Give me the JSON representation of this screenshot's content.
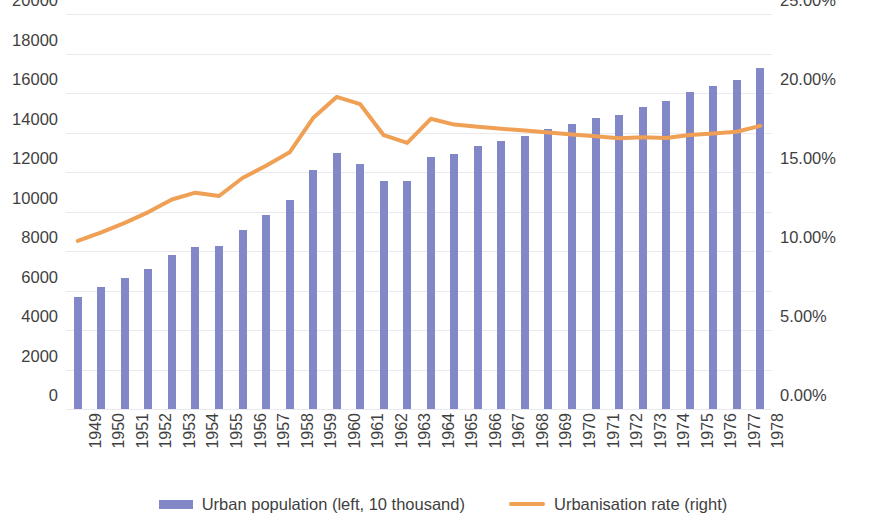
{
  "chart_data": {
    "type": "bar",
    "title": "",
    "subtitle": "",
    "xlabel": "",
    "ylabel": "",
    "y2label": "",
    "grid": true,
    "legend_position": "bottom",
    "categories": [
      "1949",
      "1950",
      "1951",
      "1952",
      "1953",
      "1954",
      "1955",
      "1956",
      "1957",
      "1958",
      "1959",
      "1960",
      "1961",
      "1962",
      "1963",
      "1964",
      "1965",
      "1966",
      "1967",
      "1968",
      "1969",
      "1970",
      "1971",
      "1972",
      "1973",
      "1974",
      "1975",
      "1976",
      "1977",
      "1978"
    ],
    "ylim": [
      0,
      20000
    ],
    "yticks": [
      0,
      2000,
      4000,
      6000,
      8000,
      10000,
      12000,
      14000,
      16000,
      18000,
      20000
    ],
    "ytick_labels": [
      "0",
      "2000",
      "4000",
      "6000",
      "8000",
      "10000",
      "12000",
      "14000",
      "16000",
      "18000",
      "20000"
    ],
    "y2lim": [
      0,
      25
    ],
    "y2ticks": [
      0,
      5,
      10,
      15,
      20,
      25
    ],
    "y2tick_labels": [
      "0.00%",
      "5.00%",
      "10.00%",
      "15.00%",
      "20.00%",
      "25.00%"
    ],
    "series": [
      {
        "name": "Urban population (left, 10 thousand)",
        "type": "bar",
        "axis": "left",
        "color": "#8287c8",
        "values": [
          5670,
          6170,
          6630,
          7100,
          7780,
          8200,
          8230,
          9050,
          9800,
          10600,
          12100,
          12950,
          12420,
          11520,
          11560,
          12750,
          12920,
          13310,
          13550,
          13800,
          14200,
          14420,
          14710,
          14900,
          15280,
          15600,
          16050,
          16350,
          16650,
          17250
        ]
      },
      {
        "name": "Urbanisation rate (right)",
        "type": "line",
        "axis": "right",
        "color": "#efa055",
        "values": [
          10.64,
          11.18,
          11.78,
          12.46,
          13.26,
          13.69,
          13.48,
          14.62,
          15.39,
          16.25,
          18.41,
          19.75,
          19.29,
          17.33,
          16.84,
          18.37,
          18.0,
          17.86,
          17.74,
          17.62,
          17.5,
          17.38,
          17.26,
          17.13,
          17.2,
          17.16,
          17.34,
          17.44,
          17.55,
          17.92
        ]
      }
    ]
  },
  "legend": {
    "entries": [
      {
        "label": "Urban population (left, 10 thousand)",
        "marker": "bar-swatch",
        "color": "#8287c8"
      },
      {
        "label": "Urbanisation rate (right)",
        "marker": "line-swatch",
        "color": "#efa055"
      }
    ]
  }
}
